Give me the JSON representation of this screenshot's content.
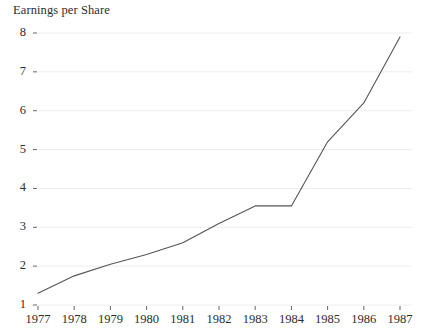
{
  "chart_data": {
    "type": "line",
    "title": "Earnings per Share",
    "xlabel": "",
    "ylabel": "",
    "x": [
      1977,
      1978,
      1979,
      1980,
      1981,
      1982,
      1983,
      1984,
      1985,
      1986,
      1987
    ],
    "values": [
      1.3,
      1.75,
      2.05,
      2.3,
      2.6,
      3.1,
      3.55,
      3.55,
      5.2,
      6.2,
      7.9
    ],
    "series": [
      {
        "name": "Earnings per Share",
        "values": [
          1.3,
          1.75,
          2.05,
          2.3,
          2.6,
          3.1,
          3.55,
          3.55,
          5.2,
          6.2,
          7.9
        ]
      }
    ],
    "xlim": [
      1977,
      1987
    ],
    "ylim": [
      1,
      8
    ],
    "ytick_labels": [
      "1",
      "2",
      "3",
      "4",
      "5",
      "6",
      "7",
      "8"
    ],
    "yticks": [
      1,
      2,
      3,
      4,
      5,
      6,
      7,
      8
    ],
    "xtick_labels": [
      "1977",
      "1978",
      "1979",
      "1980",
      "1981",
      "1982",
      "1983",
      "1984",
      "1985",
      "1986",
      "1987"
    ],
    "grid": true,
    "grid_axis": "y",
    "legend": false,
    "legend_position": "none",
    "line_color": "#555555",
    "grid_color": "#ececec",
    "background_color": "#ffffff",
    "text_color": "#2d2d2d"
  }
}
